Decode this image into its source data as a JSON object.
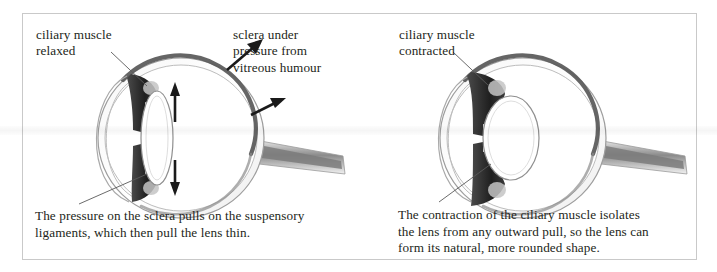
{
  "figure": {
    "panels": [
      {
        "id": "left",
        "state": "relaxed",
        "labels": [
          {
            "name": "ciliary-muscle-label",
            "text": "ciliary muscle\nrelaxed"
          },
          {
            "name": "sclera-pressure-label",
            "text": "sclera under\npressure from\nvitreous humour"
          }
        ],
        "caption": "The pressure on the sclera pulls on the suspensory\nligaments, which then pull the lens thin.",
        "arrows": [
          {
            "name": "arrow-lens-up",
            "direction": "up"
          },
          {
            "name": "arrow-lens-down",
            "direction": "down"
          },
          {
            "name": "arrow-sclera-outward-upper",
            "direction": "up-right"
          },
          {
            "name": "arrow-sclera-outward-lower",
            "direction": "up-right"
          }
        ],
        "lens_shape": "thin"
      },
      {
        "id": "right",
        "state": "contracted",
        "labels": [
          {
            "name": "ciliary-muscle-label",
            "text": "ciliary muscle\ncontracted"
          }
        ],
        "caption": "The contraction of the ciliary muscle isolates\nthe lens from any outward pull, so the lens can\nform its natural, more rounded shape.",
        "arrows": [],
        "lens_shape": "rounded"
      }
    ],
    "colors": {
      "text": "#231f20",
      "frame_border": "#c9c9c9",
      "sclera_outline": "#8f8f8f",
      "choroid": "#6e6e6e",
      "ciliary_muscle": "#2b2b2b",
      "lens_outline": "#8a8a8a",
      "leader_line": "#5a5a5a",
      "page_background": "#ffffff"
    }
  }
}
